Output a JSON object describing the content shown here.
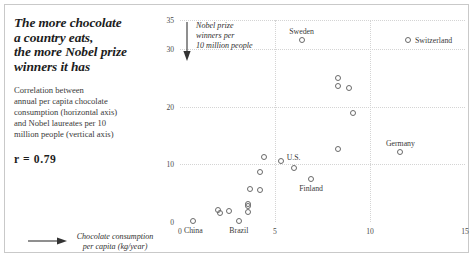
{
  "headline": {
    "lines": [
      "The more chocolate",
      "a country eats,",
      "the more Nobel prize",
      "winners it has"
    ],
    "deck": [
      "Correlation between",
      "annual per capita chocolate",
      "consumption (horizontal axis)",
      "and Nobel laureates per 10",
      "million people (vertical axis)"
    ],
    "correlation": "r =  0.79"
  },
  "chart_data": {
    "type": "scatter",
    "title": "The more chocolate a country eats, the more Nobel prize winners it has",
    "xlabel": "Chocolate consumption per capita (kg/year)",
    "ylabel": "Nobel prize winners per 10 million people",
    "xlabel_lines": [
      "Chocolate consumption",
      "per capita (kg/year)"
    ],
    "ylabel_lines": [
      "Nobel prize",
      "winners per",
      "10 million people"
    ],
    "correlation_r": 0.79,
    "xlim": [
      0,
      15
    ],
    "ylim": [
      0,
      35
    ],
    "xticks": [
      0,
      5,
      10,
      15
    ],
    "yticks": [
      0,
      10,
      20,
      30,
      35
    ],
    "grid": "dotted-light-gray",
    "gridlines_x": [
      5,
      10
    ],
    "gridlines_y": [
      10,
      20,
      30,
      35
    ],
    "legend": "none",
    "marker": "open-circle",
    "marker_color": "#6a6a6a",
    "points": [
      {
        "x": 0.7,
        "y": 0.2,
        "label": "China"
      },
      {
        "x": 2.0,
        "y": 2.0,
        "label": ""
      },
      {
        "x": 2.1,
        "y": 1.6,
        "label": ""
      },
      {
        "x": 2.6,
        "y": 1.9,
        "label": ""
      },
      {
        "x": 3.1,
        "y": 0.1,
        "label": "Brazil"
      },
      {
        "x": 3.6,
        "y": 3.2,
        "label": ""
      },
      {
        "x": 3.6,
        "y": 2.7,
        "label": ""
      },
      {
        "x": 3.6,
        "y": 1.8,
        "label": ""
      },
      {
        "x": 3.7,
        "y": 5.8,
        "label": ""
      },
      {
        "x": 4.2,
        "y": 5.5,
        "label": ""
      },
      {
        "x": 4.2,
        "y": 8.6,
        "label": ""
      },
      {
        "x": 4.4,
        "y": 11.2,
        "label": ""
      },
      {
        "x": 5.3,
        "y": 10.5,
        "label": "U.S."
      },
      {
        "x": 6.0,
        "y": 9.3,
        "label": ""
      },
      {
        "x": 6.4,
        "y": 31.5,
        "label": "Sweden"
      },
      {
        "x": 6.9,
        "y": 7.5,
        "label": "Finland"
      },
      {
        "x": 8.3,
        "y": 25.0,
        "label": ""
      },
      {
        "x": 8.3,
        "y": 23.6,
        "label": ""
      },
      {
        "x": 8.3,
        "y": 12.6,
        "label": ""
      },
      {
        "x": 8.9,
        "y": 23.2,
        "label": ""
      },
      {
        "x": 9.1,
        "y": 18.8,
        "label": ""
      },
      {
        "x": 11.6,
        "y": 12.2,
        "label": "Germany"
      },
      {
        "x": 12.0,
        "y": 31.5,
        "label": "Switzerland"
      }
    ],
    "point_labels": [
      {
        "text": "China",
        "x": 0.7,
        "y": 0.2,
        "pos": "below"
      },
      {
        "text": "Brazil",
        "x": 3.1,
        "y": 0.1,
        "pos": "below"
      },
      {
        "text": "U.S.",
        "x": 5.3,
        "y": 10.5,
        "pos": "upper-right"
      },
      {
        "text": "Finland",
        "x": 6.9,
        "y": 7.5,
        "pos": "below"
      },
      {
        "text": "Sweden",
        "x": 6.4,
        "y": 31.5,
        "pos": "above"
      },
      {
        "text": "Germany",
        "x": 11.6,
        "y": 12.2,
        "pos": "above"
      },
      {
        "text": "Switzerland",
        "x": 12.0,
        "y": 31.5,
        "pos": "right"
      }
    ]
  }
}
